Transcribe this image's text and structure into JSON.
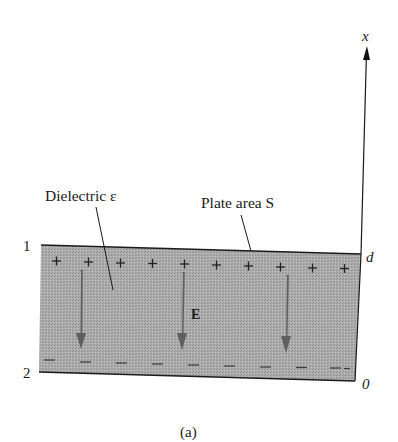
{
  "figure": {
    "caption": "(a)",
    "axis": {
      "label": "x",
      "top_tick": "d",
      "bottom_tick": "0"
    },
    "plates": {
      "top_label": "1",
      "bottom_label": "2"
    },
    "annotations": {
      "dielectric": "Dielectric ε",
      "plate_area": "Plate area S",
      "field": "E"
    },
    "charges": {
      "top_sign": "+",
      "bottom_sign": "−",
      "top_count": 10,
      "bottom_count": 10
    },
    "field_arrows": 3,
    "colors": {
      "dielectric_fill": "#a9a9a9",
      "arrow": "#5f5f5f",
      "ink": "#1a1a1a",
      "background": "#ffffff"
    }
  }
}
